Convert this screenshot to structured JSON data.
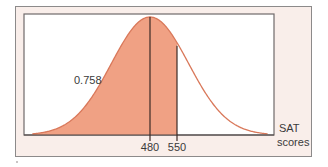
{
  "chart_data": {
    "type": "area",
    "title": "",
    "distribution": "normal",
    "mean": 480,
    "sd": 100,
    "xlabel": "SAT scores",
    "xlabel_lines": [
      "SAT",
      "scores"
    ],
    "ylabel": "",
    "x_ticks": [
      480,
      550
    ],
    "x_tick_labels": [
      "480",
      "550"
    ],
    "xlim": [
      150,
      800
    ],
    "shaded_region": {
      "from": "-inf",
      "to": 550,
      "area": 0.758
    },
    "annotations": [
      {
        "text": "0.758",
        "meaning": "P(SAT score < 550)"
      }
    ],
    "vertical_lines": [
      480,
      550
    ],
    "grid": false,
    "legend": null
  },
  "colors": {
    "fill": "#f0a184",
    "curve": "#d9785a",
    "lines": "#3b2a26",
    "panel_bg": "#f9eeea",
    "plot_bg": "#ffffff",
    "border": "#8c8a8a"
  },
  "labels": {
    "area_value": "0.758",
    "tick_mean": "480",
    "tick_550": "550",
    "axis_line1": "SAT",
    "axis_line2": "scores"
  }
}
